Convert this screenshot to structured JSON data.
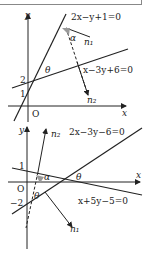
{
  "diagram1": {
    "line1": "2x−y+1=0",
    "line2": "x−3y+6=0",
    "vec1": "n₁",
    "vec2": "n₂",
    "angle_alpha": "α",
    "angle_theta": "θ",
    "tick2": "2",
    "tick1": "1",
    "origin": "O",
    "xlabel": "x",
    "ylabel": "y"
  },
  "diagram2": {
    "line1": "2x−3y−6=0",
    "line2": "x+5y−5=0",
    "vec1": "n₁",
    "vec2": "n₂",
    "angle_alpha": "α",
    "angle_theta": "θ",
    "tick1": "1",
    "tickm2": "−2",
    "origin": "O",
    "xlabel": "x",
    "ylabel": "y"
  }
}
